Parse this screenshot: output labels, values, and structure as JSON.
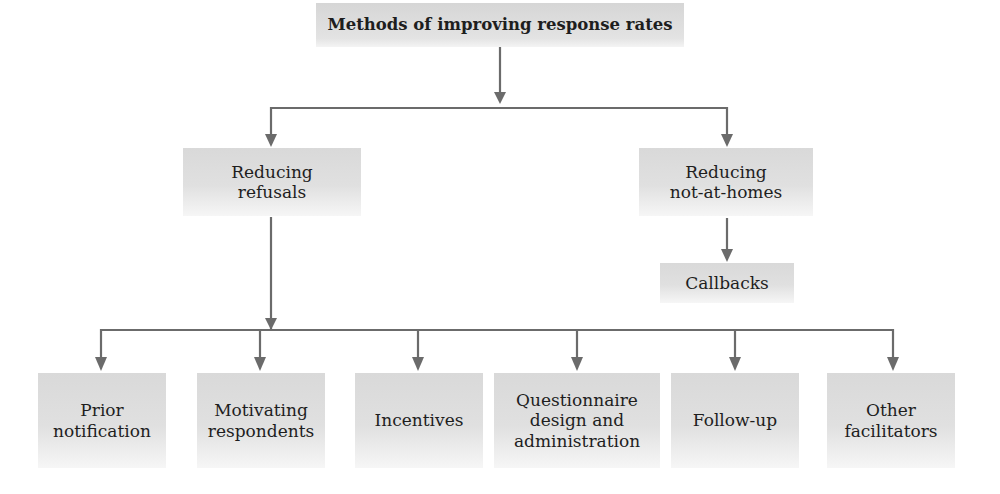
{
  "diagram": {
    "title": "Methods of improving response rates",
    "branches": [
      {
        "label_lines": [
          "Reducing",
          "refusals"
        ],
        "children": [
          {
            "label_lines": [
              "Prior",
              "notification"
            ]
          },
          {
            "label_lines": [
              "Motivating",
              "respondents"
            ]
          },
          {
            "label_lines": [
              "Incentives"
            ]
          },
          {
            "label_lines": [
              "Questionnaire",
              "design and",
              "administration"
            ]
          },
          {
            "label_lines": [
              "Follow-up"
            ]
          },
          {
            "label_lines": [
              "Other",
              "facilitators"
            ]
          }
        ]
      },
      {
        "label_lines": [
          "Reducing",
          "not-at-homes"
        ],
        "children": [
          {
            "label_lines": [
              "Callbacks"
            ]
          }
        ]
      }
    ],
    "colors": {
      "connector": "#6b6b6b",
      "box_fill": "#dedede",
      "text": "#1e1e1e",
      "background": "#ffffff"
    }
  }
}
